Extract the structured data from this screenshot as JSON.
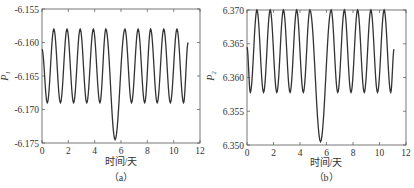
{
  "chart_data": [
    {
      "type": "line",
      "panel": "a",
      "caption": "（a）",
      "xlabel": "时间/天",
      "ylabel": "P₁",
      "xlim": [
        0,
        12
      ],
      "ylim": [
        -6.175,
        -6.155
      ],
      "xticks": [
        0,
        2,
        4,
        6,
        8,
        10,
        12
      ],
      "xtick_labels": [
        "0",
        "2",
        "4",
        "6",
        "8",
        "10",
        "12"
      ],
      "yticks": [
        -6.155,
        -6.16,
        -6.165,
        -6.17,
        -6.175
      ],
      "ytick_labels": [
        "-6.155",
        "-6.160",
        "-6.165",
        "-6.170",
        "-6.175"
      ],
      "grid": false,
      "series": [
        {
          "name": "P1",
          "color": "#333333",
          "x": [
            0,
            0.4,
            0.9,
            1.4,
            1.9,
            2.4,
            2.9,
            3.4,
            3.9,
            4.4,
            4.85,
            5.55,
            6.3,
            6.8,
            7.3,
            7.8,
            8.25,
            8.75,
            9.25,
            9.75,
            10.25,
            10.75,
            11.1
          ],
          "y": [
            -6.161,
            -6.169,
            -6.158,
            -6.169,
            -6.158,
            -6.169,
            -6.158,
            -6.169,
            -6.158,
            -6.169,
            -6.158,
            -6.1745,
            -6.158,
            -6.169,
            -6.158,
            -6.169,
            -6.158,
            -6.169,
            -6.158,
            -6.169,
            -6.158,
            -6.169,
            -6.16
          ]
        }
      ]
    },
    {
      "type": "line",
      "panel": "b",
      "caption": "（b）",
      "xlabel": "时间/天",
      "ylabel": "P₂",
      "xlim": [
        0,
        12
      ],
      "ylim": [
        6.35,
        6.37
      ],
      "xticks": [
        0,
        2,
        4,
        6,
        8,
        10,
        12
      ],
      "xtick_labels": [
        "0",
        "2",
        "4",
        "6",
        "8",
        "10",
        "12"
      ],
      "yticks": [
        6.37,
        6.365,
        6.36,
        6.355,
        6.35
      ],
      "ytick_labels": [
        "6.370",
        "6.365",
        "6.360",
        "6.355",
        "6.350"
      ],
      "grid": false,
      "series": [
        {
          "name": "P2",
          "color": "#333333",
          "x": [
            0,
            0.25,
            0.75,
            1.25,
            1.75,
            2.25,
            2.75,
            3.25,
            3.75,
            4.25,
            4.75,
            5.55,
            6.35,
            6.85,
            7.35,
            7.85,
            8.35,
            8.85,
            9.35,
            9.85,
            10.35,
            10.85,
            11.1
          ],
          "y": [
            6.3645,
            6.3578,
            6.37,
            6.3578,
            6.37,
            6.3578,
            6.37,
            6.3578,
            6.37,
            6.3578,
            6.37,
            6.3505,
            6.37,
            6.3578,
            6.37,
            6.3578,
            6.37,
            6.3578,
            6.37,
            6.3578,
            6.37,
            6.3578,
            6.3642
          ]
        }
      ]
    }
  ]
}
